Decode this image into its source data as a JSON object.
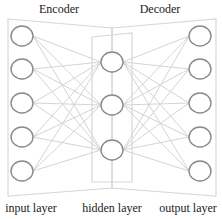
{
  "sections": {
    "encoder": "Encoder",
    "decoder": "Decoder"
  },
  "layers": [
    {
      "id": "input",
      "label": "input layer",
      "node_count": 5
    },
    {
      "id": "hidden",
      "label": "hidden layer",
      "node_count": 3
    },
    {
      "id": "output",
      "label": "output layer",
      "node_count": 5
    }
  ],
  "colors": {
    "node_stroke": "#8a8a8a",
    "edge_stroke": "#d4d4d4",
    "outline_stroke": "#d8d8d8",
    "text": "#222222",
    "background": "#ffffff"
  },
  "geometry": {
    "input_x": 22,
    "hidden_x": 112,
    "output_x": 200,
    "input_y": [
      36,
      69,
      103,
      137,
      171
    ],
    "hidden_y": [
      62,
      105,
      150
    ],
    "output_y": [
      36,
      69,
      103,
      137,
      171
    ],
    "node_rx": 11,
    "node_ry": 10
  }
}
